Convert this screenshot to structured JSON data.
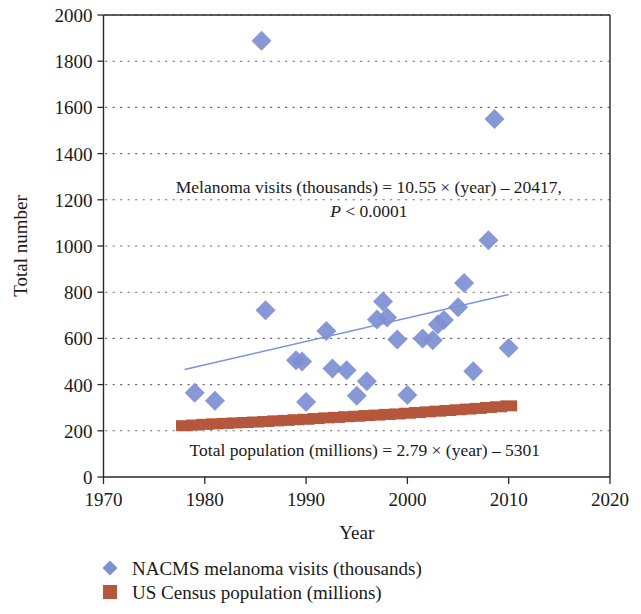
{
  "chart_data": {
    "type": "scatter",
    "title": "",
    "xlabel": "Year",
    "ylabel": "Total number",
    "xlim": [
      1970,
      2020
    ],
    "ylim": [
      0,
      2000
    ],
    "xticks": [
      "1970",
      "1980",
      "1990",
      "2000",
      "2010",
      "2020"
    ],
    "yticks": [
      "0",
      "200",
      "400",
      "600",
      "800",
      "1000",
      "1200",
      "1400",
      "1600",
      "1800",
      "2000"
    ],
    "grid": "horizontal dotted",
    "legend_position": "below-left",
    "annotations": [
      {
        "name": "melanoma-regression",
        "line1": "Melanoma visits (thousands) = 10.55 × (year) – 20417,",
        "line2_italic": "P",
        "line2_rest": " < 0.0001"
      },
      {
        "name": "population-regression",
        "line1": "Total population (millions) = 2.79 × (year) – 5301"
      }
    ],
    "series": [
      {
        "name": "NACMS melanoma visits (thousands)",
        "marker": "diamond",
        "color": "#7d8fd2",
        "points": [
          [
            1979,
            365
          ],
          [
            1981,
            330
          ],
          [
            1985.6,
            1888
          ],
          [
            1986,
            722
          ],
          [
            1989,
            505
          ],
          [
            1989.6,
            500
          ],
          [
            1990,
            325
          ],
          [
            1992,
            632
          ],
          [
            1992.6,
            470
          ],
          [
            1994,
            462
          ],
          [
            1995,
            352
          ],
          [
            1996,
            415
          ],
          [
            1997,
            682
          ],
          [
            1997.6,
            760
          ],
          [
            1998,
            690
          ],
          [
            1999,
            595
          ],
          [
            2000,
            355
          ],
          [
            2001.5,
            600
          ],
          [
            2002.5,
            592
          ],
          [
            2003,
            660
          ],
          [
            2003.6,
            680
          ],
          [
            2005,
            735
          ],
          [
            2005.6,
            840
          ],
          [
            2006.5,
            458
          ],
          [
            2008,
            1025
          ],
          [
            2008.6,
            1550
          ],
          [
            2010,
            558
          ]
        ],
        "trend": {
          "x1": 1978,
          "y1": 465,
          "x2": 2010,
          "y2": 790
        }
      },
      {
        "name": "US Census population (millions)",
        "marker": "square",
        "color": "#b5573c",
        "points": [
          [
            1978,
            222
          ],
          [
            1979,
            225
          ],
          [
            1980,
            228
          ],
          [
            1981,
            230
          ],
          [
            1982,
            232
          ],
          [
            1983,
            234
          ],
          [
            1984,
            236
          ],
          [
            1985,
            238
          ],
          [
            1986,
            240
          ],
          [
            1987,
            243
          ],
          [
            1988,
            245
          ],
          [
            1989,
            248
          ],
          [
            1990,
            250
          ],
          [
            1991,
            253
          ],
          [
            1992,
            256
          ],
          [
            1993,
            258
          ],
          [
            1994,
            261
          ],
          [
            1995,
            263
          ],
          [
            1996,
            266
          ],
          [
            1997,
            268
          ],
          [
            1998,
            271
          ],
          [
            1999,
            273
          ],
          [
            2000,
            276
          ],
          [
            2001,
            279
          ],
          [
            2002,
            282
          ],
          [
            2003,
            285
          ],
          [
            2004,
            288
          ],
          [
            2005,
            291
          ],
          [
            2006,
            294
          ],
          [
            2007,
            297
          ],
          [
            2008,
            301
          ],
          [
            2009,
            304
          ],
          [
            2010,
            308
          ]
        ]
      }
    ]
  },
  "axes": {
    "y_title": "Total number",
    "x_title": "Year"
  },
  "legend": {
    "items": [
      {
        "label": "NACMS melanoma visits (thousands)",
        "marker": "diamond",
        "color": "#7d8fd2"
      },
      {
        "label": "US Census population (millions)",
        "marker": "square",
        "color": "#b5573c"
      }
    ]
  }
}
